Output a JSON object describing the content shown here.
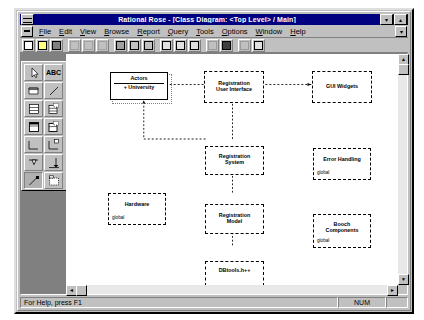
{
  "window": {
    "title": "Rational Rose - [Class Diagram: <Top Level> / Main]",
    "minimize_label": "▾",
    "maximize_label": "▴",
    "mdi_restore_label": "▾"
  },
  "menubar": {
    "items": [
      {
        "label": "File",
        "accel": "F"
      },
      {
        "label": "Edit",
        "accel": "E"
      },
      {
        "label": "View",
        "accel": "V"
      },
      {
        "label": "Browse",
        "accel": "B"
      },
      {
        "label": "Report",
        "accel": "R"
      },
      {
        "label": "Query",
        "accel": "Q"
      },
      {
        "label": "Tools",
        "accel": "T"
      },
      {
        "label": "Options",
        "accel": "O"
      },
      {
        "label": "Window",
        "accel": "W"
      },
      {
        "label": "Help",
        "accel": "H"
      }
    ]
  },
  "toolbar": {
    "buttons": [
      {
        "name": "new-model-button",
        "icon": "new-document-icon",
        "enabled": true
      },
      {
        "name": "open-model-button",
        "icon": "open-folder-icon",
        "enabled": true
      },
      {
        "name": "save-model-button",
        "icon": "floppy-disk-icon",
        "enabled": true
      },
      {
        "name": "cut-button",
        "icon": "scissors-icon",
        "enabled": false
      },
      {
        "name": "copy-button",
        "icon": "copy-icon",
        "enabled": false
      },
      {
        "name": "paste-button",
        "icon": "clipboard-icon",
        "enabled": false
      },
      {
        "name": "print-button",
        "icon": "printer-icon",
        "enabled": true
      },
      {
        "name": "query-button",
        "icon": "funnel-icon",
        "enabled": true
      },
      {
        "name": "browse-button",
        "icon": "browse-icon",
        "enabled": true
      },
      {
        "name": "class-diagram-button",
        "icon": "class-diagram-icon",
        "enabled": true
      },
      {
        "name": "use-case-diagram-button",
        "icon": "use-case-diagram-icon",
        "enabled": true
      },
      {
        "name": "state-diagram-button",
        "icon": "state-diagram-icon",
        "enabled": true
      },
      {
        "name": "zoom-in-button",
        "icon": "zoom-in-icon",
        "enabled": false
      },
      {
        "name": "fit-in-window-button",
        "icon": "fit-window-icon",
        "enabled": true
      },
      {
        "name": "undo-button",
        "icon": "undo-icon",
        "enabled": false
      },
      {
        "name": "redo-button",
        "icon": "redo-icon",
        "enabled": true
      }
    ]
  },
  "toolbox": {
    "tools": [
      {
        "name": "selection-tool",
        "icon": "arrow-cursor-icon",
        "label": "",
        "selected": false
      },
      {
        "name": "text-tool",
        "icon": "abc-text-icon",
        "label": "ABC",
        "selected": false
      },
      {
        "name": "note-tool",
        "icon": "note-icon",
        "label": "",
        "selected": false
      },
      {
        "name": "note-anchor-tool",
        "icon": "anchor-line-icon",
        "label": "",
        "selected": false
      },
      {
        "name": "class-tool",
        "icon": "class-box-icon",
        "label": "",
        "selected": false
      },
      {
        "name": "parameterized-class-tool",
        "icon": "parameterized-class-icon",
        "label": "",
        "selected": false
      },
      {
        "name": "class-utility-tool",
        "icon": "class-utility-icon",
        "label": "",
        "selected": false
      },
      {
        "name": "parameterized-class-utility-tool",
        "icon": "param-class-utility-icon",
        "label": "",
        "selected": false
      },
      {
        "name": "association-tool",
        "icon": "association-line-icon",
        "label": "",
        "selected": false
      },
      {
        "name": "association-class-tool",
        "icon": "association-class-icon",
        "label": "",
        "selected": false
      },
      {
        "name": "aggregation-tool",
        "icon": "aggregation-diamond-icon",
        "label": "",
        "selected": false
      },
      {
        "name": "inheritance-tool",
        "icon": "inheritance-arrow-icon",
        "label": "",
        "selected": false
      },
      {
        "name": "dependency-tool",
        "icon": "dependency-arrow-icon",
        "label": "",
        "selected": true
      },
      {
        "name": "package-tool",
        "icon": "package-box-icon",
        "label": "",
        "selected": false
      }
    ]
  },
  "diagram": {
    "actor": {
      "name": "actor-class-box",
      "title": "Actors",
      "attribute": "+  University"
    },
    "packages": [
      {
        "name": "registration-user-interface-package",
        "title": "Registration\nUser Interface",
        "line1": "Registration",
        "line2": "User Interface",
        "global": ""
      },
      {
        "name": "gui-widgets-package",
        "title": "GUI Widgets",
        "line1": "GUI Widgets",
        "line2": "",
        "global": ""
      },
      {
        "name": "registration-system-package",
        "title": "Registration\nSystem",
        "line1": "Registration",
        "line2": "System",
        "global": ""
      },
      {
        "name": "error-handling-package",
        "title": "Error Handling",
        "line1": "Error Handling",
        "line2": "",
        "global": "global"
      },
      {
        "name": "hardware-package",
        "title": "Hardware",
        "line1": "Hardware",
        "line2": "",
        "global": "global"
      },
      {
        "name": "registration-model-package",
        "title": "Registration\nModel",
        "line1": "Registration",
        "line2": "Model",
        "global": ""
      },
      {
        "name": "booch-components-package",
        "title": "Booch\nComponents",
        "line1": "Booch",
        "line2": "Components",
        "global": "global"
      },
      {
        "name": "dbtools-package",
        "title": "DBtools.h++",
        "line1": "DBtools.h++",
        "line2": "",
        "global": ""
      }
    ]
  },
  "status": {
    "hint": "For Help, press F1",
    "num_indicator": "NUM",
    "extra_indicator": ""
  },
  "scrollbars": {
    "up_arrow": "▲",
    "down_arrow": "▼",
    "left_arrow": "◄",
    "right_arrow": "►"
  },
  "colors": {
    "titlebar": "#000080",
    "face": "#c0c0c0",
    "canvas": "#ffffff",
    "mdi_background": "#808080"
  }
}
